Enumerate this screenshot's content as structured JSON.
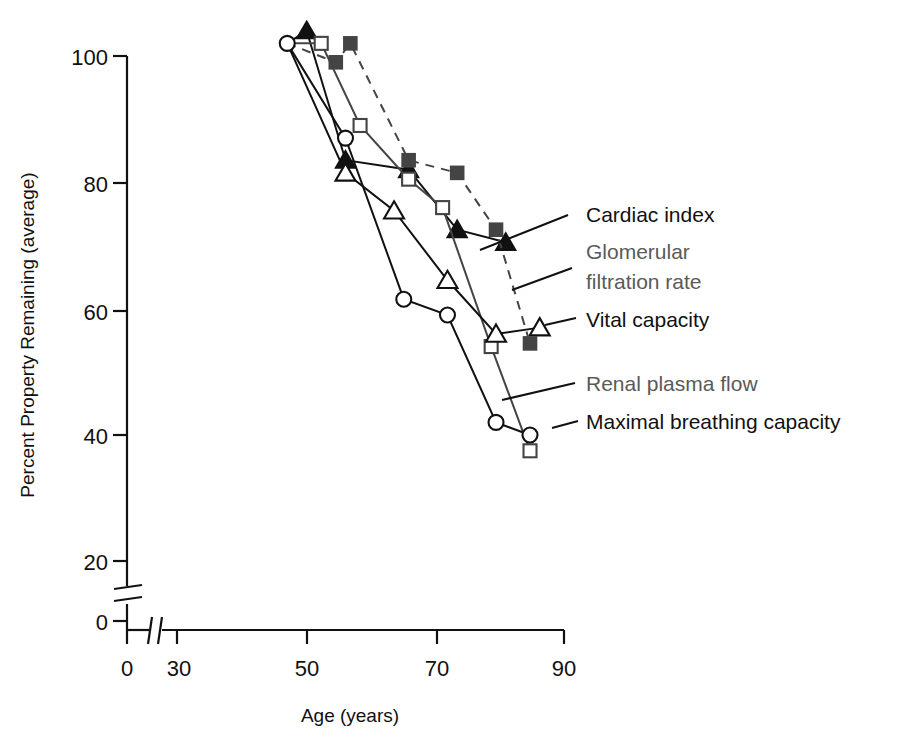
{
  "chart_data": {
    "type": "line",
    "title": "",
    "xlabel": "Age (years)",
    "ylabel": "Percent Property Remaining (average)",
    "xlim": [
      0,
      90
    ],
    "ylim": [
      0,
      105
    ],
    "xticks": [
      0,
      30,
      50,
      70,
      90
    ],
    "yticks": [
      0,
      20,
      40,
      60,
      80,
      100
    ],
    "axis_breaks": {
      "x_between": [
        0,
        30
      ],
      "y_between": [
        0,
        20
      ]
    },
    "grid": false,
    "legend_position": "right-inline-leader-lines",
    "series": [
      {
        "name": "Cardiac index",
        "marker": "filled-triangle",
        "line": "solid",
        "color": "#111111",
        "label_color": "#111111",
        "points": [
          [
            33,
            102
          ],
          [
            37,
            104
          ],
          [
            45,
            83.5
          ],
          [
            58,
            82.0
          ],
          [
            68,
            72.5
          ],
          [
            78,
            70.5
          ]
        ]
      },
      {
        "name": "Glomerular filtration rate",
        "marker": "open-square",
        "line": "solid",
        "color": "#444444",
        "label_color": "#5a5a5a",
        "points": [
          [
            33,
            102
          ],
          [
            40,
            102
          ],
          [
            48,
            89
          ],
          [
            58,
            80.5
          ],
          [
            65,
            76
          ],
          [
            75,
            54
          ],
          [
            83,
            37.5
          ]
        ]
      },
      {
        "name": "Vital capacity",
        "marker": "open-triangle",
        "line": "solid",
        "color": "#111111",
        "label_color": "#111111",
        "points": [
          [
            33,
            102
          ],
          [
            45,
            81.5
          ],
          [
            55,
            75.5
          ],
          [
            66,
            64.5
          ],
          [
            76,
            56
          ],
          [
            85,
            57
          ]
        ]
      },
      {
        "name": "Renal plasma flow",
        "marker": "filled-square",
        "line": "dashed",
        "color": "#444444",
        "label_color": "#5a5a5a",
        "points": [
          [
            33,
            102
          ],
          [
            43,
            99
          ],
          [
            46,
            102
          ],
          [
            58,
            83.5
          ],
          [
            68,
            81.5
          ],
          [
            76,
            72.5
          ],
          [
            83,
            54.5
          ]
        ]
      },
      {
        "name": "Maximal breathing capacity",
        "marker": "open-circle",
        "line": "solid",
        "color": "#111111",
        "label_color": "#111111",
        "points": [
          [
            33,
            102
          ],
          [
            45,
            87
          ],
          [
            57,
            61.5
          ],
          [
            66,
            59
          ],
          [
            76,
            42
          ],
          [
            83,
            40
          ]
        ]
      }
    ]
  },
  "axes": {
    "x_title": "Age (years)",
    "y_title": "Percent Property Remaining (average)",
    "x_tick_labels": [
      "0",
      "30",
      "50",
      "70",
      "90"
    ],
    "y_tick_labels": [
      "0",
      "20",
      "40",
      "60",
      "80",
      "100"
    ]
  },
  "labels": {
    "cardiac_index": "Cardiac index",
    "glomerular_line1": "Glomerular",
    "glomerular_line2": "filtration rate",
    "vital_capacity": "Vital capacity",
    "renal_plasma_flow": "Renal plasma flow",
    "maximal_breathing_capacity": "Maximal breathing capacity"
  },
  "colors": {
    "ink": "#111111",
    "gray_text": "#5a5a5a",
    "background": "#ffffff"
  }
}
